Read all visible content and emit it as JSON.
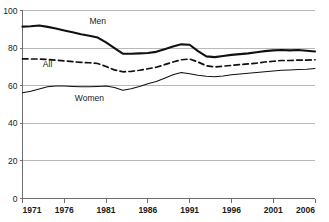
{
  "chart_data": {
    "type": "line",
    "title": "",
    "subtitle": "",
    "xlabel": "",
    "ylabel": "",
    "xlim": [
      1971,
      2006
    ],
    "ylim": [
      0,
      100
    ],
    "grid": true,
    "legend_position": "inline-annotations",
    "xticks": [
      "1971",
      "1976",
      "1981",
      "1986",
      "1991",
      "1996",
      "2001",
      "2006"
    ],
    "xtick_values": [
      1971,
      1976,
      1981,
      1986,
      1991,
      1996,
      2001,
      2006
    ],
    "yticks": [
      "0",
      "20",
      "40",
      "60",
      "80",
      "100"
    ],
    "ytick_values": [
      0,
      20,
      40,
      60,
      80,
      100
    ],
    "x": [
      1971,
      1972,
      1973,
      1974,
      1975,
      1976,
      1977,
      1978,
      1979,
      1980,
      1981,
      1982,
      1983,
      1984,
      1985,
      1986,
      1987,
      1988,
      1989,
      1990,
      1991,
      1992,
      1993,
      1994,
      1995,
      1996,
      1997,
      1998,
      1999,
      2000,
      2001,
      2002,
      2003,
      2004,
      2005,
      2006
    ],
    "series": [
      {
        "name": "Men",
        "style": "solid-thick",
        "color": "#101010",
        "label": "Men",
        "label_x": 1980,
        "label_y": 93,
        "values": [
          91.4,
          91.6,
          92.0,
          91.3,
          90.4,
          89.4,
          88.4,
          87.4,
          86.6,
          85.6,
          83.0,
          80.0,
          77.0,
          77.0,
          77.2,
          77.4,
          78.0,
          79.4,
          80.8,
          82.0,
          81.8,
          78.4,
          75.6,
          75.2,
          75.8,
          76.4,
          76.8,
          77.2,
          77.8,
          78.4,
          78.8,
          79.0,
          78.8,
          79.0,
          78.6,
          78.2
        ]
      },
      {
        "name": "All",
        "style": "dashed",
        "color": "#101010",
        "label": "All",
        "label_x": 1974,
        "label_y": 70,
        "values": [
          74.3,
          74.2,
          74.2,
          74.0,
          73.6,
          73.2,
          72.8,
          72.4,
          72.2,
          71.8,
          70.2,
          68.4,
          67.4,
          67.6,
          68.2,
          69.0,
          69.8,
          71.2,
          72.6,
          73.8,
          74.2,
          72.6,
          70.6,
          70.0,
          70.4,
          70.8,
          71.2,
          71.6,
          72.0,
          72.6,
          73.0,
          73.4,
          73.4,
          73.6,
          73.6,
          73.8
        ]
      },
      {
        "name": "Women",
        "style": "solid-thin",
        "color": "#101010",
        "label": "Women",
        "label_x": 1979,
        "label_y": 52,
        "values": [
          56.2,
          57.0,
          58.2,
          59.4,
          59.8,
          59.8,
          59.6,
          59.4,
          59.4,
          59.6,
          59.8,
          59.0,
          57.6,
          58.4,
          59.6,
          61.0,
          62.2,
          64.0,
          65.8,
          67.0,
          66.4,
          65.6,
          65.0,
          64.8,
          65.2,
          65.8,
          66.2,
          66.6,
          67.0,
          67.4,
          67.8,
          68.2,
          68.4,
          68.6,
          68.8,
          69.2
        ]
      }
    ]
  }
}
